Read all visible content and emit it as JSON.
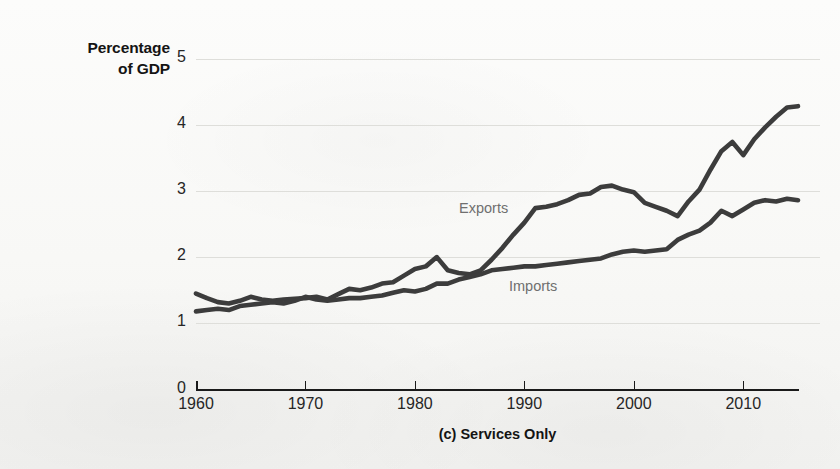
{
  "figure": {
    "y_axis_title_line1": "Percentage",
    "y_axis_title_line2": "of GDP",
    "caption": "(c) Services Only",
    "series_label_exports": "Exports",
    "series_label_imports": "Imports"
  },
  "chart_data": {
    "type": "line",
    "title": "(c) Services Only",
    "xlabel": "",
    "ylabel": "Percentage of GDP",
    "xlim": [
      1960,
      2015
    ],
    "ylim": [
      0,
      5
    ],
    "yticks": [
      0,
      1,
      2,
      3,
      4,
      5
    ],
    "ytick_labels": [
      "0",
      "1",
      "2",
      "3",
      "4",
      "5"
    ],
    "xticks": [
      1960,
      1970,
      1980,
      1990,
      2000,
      2010
    ],
    "xtick_labels": [
      "1960",
      "1970",
      "1980",
      "1990",
      "2000",
      "2010"
    ],
    "grid": "horizontal",
    "legend_position": "inline-annotations",
    "line_color": "#3c3c3c",
    "annotation_color": "#6f6f6f",
    "x": [
      1960,
      1961,
      1962,
      1963,
      1964,
      1965,
      1966,
      1967,
      1968,
      1969,
      1970,
      1971,
      1972,
      1973,
      1974,
      1975,
      1976,
      1977,
      1978,
      1979,
      1980,
      1981,
      1982,
      1983,
      1984,
      1985,
      1986,
      1987,
      1988,
      1989,
      1990,
      1991,
      1992,
      1993,
      1994,
      1995,
      1996,
      1997,
      1998,
      1999,
      2000,
      2001,
      2002,
      2003,
      2004,
      2005,
      2006,
      2007,
      2008,
      2009,
      2010,
      2011,
      2012,
      2013,
      2014,
      2015
    ],
    "series": [
      {
        "name": "Exports",
        "values": [
          1.45,
          1.38,
          1.32,
          1.3,
          1.34,
          1.4,
          1.36,
          1.34,
          1.36,
          1.37,
          1.38,
          1.4,
          1.36,
          1.44,
          1.52,
          1.5,
          1.54,
          1.6,
          1.62,
          1.72,
          1.82,
          1.86,
          2.0,
          1.8,
          1.76,
          1.74,
          1.8,
          1.96,
          2.14,
          2.34,
          2.52,
          2.74,
          2.76,
          2.8,
          2.86,
          2.94,
          2.96,
          3.06,
          3.08,
          3.02,
          2.98,
          2.82,
          2.76,
          2.7,
          2.62,
          2.84,
          3.02,
          3.32,
          3.6,
          3.74,
          3.54,
          3.78,
          3.96,
          4.12,
          4.26,
          4.28
        ]
      },
      {
        "name": "Imports",
        "values": [
          1.18,
          1.2,
          1.22,
          1.2,
          1.26,
          1.28,
          1.3,
          1.32,
          1.3,
          1.34,
          1.4,
          1.36,
          1.34,
          1.36,
          1.38,
          1.38,
          1.4,
          1.42,
          1.46,
          1.5,
          1.48,
          1.52,
          1.6,
          1.6,
          1.66,
          1.7,
          1.74,
          1.8,
          1.82,
          1.84,
          1.86,
          1.86,
          1.88,
          1.9,
          1.92,
          1.94,
          1.96,
          1.98,
          2.04,
          2.08,
          2.1,
          2.08,
          2.1,
          2.12,
          2.26,
          2.34,
          2.4,
          2.52,
          2.7,
          2.62,
          2.72,
          2.82,
          2.86,
          2.84,
          2.88,
          2.86
        ]
      }
    ]
  }
}
